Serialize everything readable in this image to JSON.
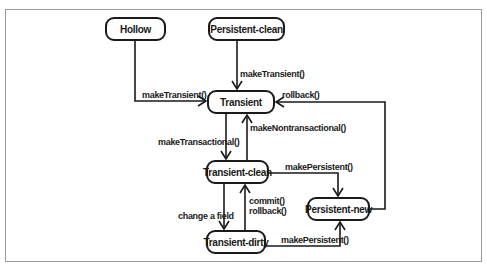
{
  "diagram": {
    "type": "state-diagram",
    "states": [
      {
        "id": "hollow",
        "label": "Hollow"
      },
      {
        "id": "persistent_clean",
        "label": "Persistent-clean"
      },
      {
        "id": "transient",
        "label": "Transient"
      },
      {
        "id": "transient_clean",
        "label": "Transient-clean"
      },
      {
        "id": "persistent_new",
        "label": "Persistent-new"
      },
      {
        "id": "transient_dirty",
        "label": "Transient-dirty"
      }
    ],
    "transitions": [
      {
        "from": "Hollow",
        "to": "Transient",
        "label": "makeTransient()"
      },
      {
        "from": "Persistent-clean",
        "to": "Transient",
        "label": "makeTransient()"
      },
      {
        "from": "Persistent-new",
        "to": "Transient",
        "label": "rollback()"
      },
      {
        "from": "Transient",
        "to": "Transient-clean",
        "label": "makeTransactional()"
      },
      {
        "from": "Transient-clean",
        "to": "Transient",
        "label": "makeNontransactional()"
      },
      {
        "from": "Transient-clean",
        "to": "Persistent-new",
        "label": "makePersistent()"
      },
      {
        "from": "Transient-clean",
        "to": "Transient-dirty",
        "label": "change a field"
      },
      {
        "from": "Transient-dirty",
        "to": "Transient-clean",
        "label_line1": "commit()",
        "label_line2": "rollback()"
      },
      {
        "from": "Transient-dirty",
        "to": "Persistent-new",
        "label": "makePersistent()"
      }
    ]
  }
}
